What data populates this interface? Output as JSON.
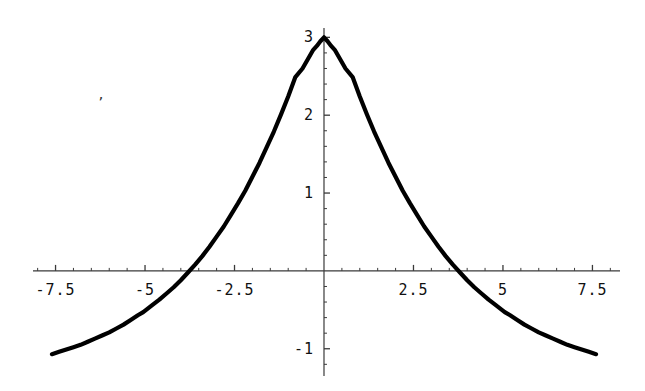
{
  "chart_data": {
    "type": "line",
    "title": "",
    "subtitle": "",
    "xlabel": "",
    "ylabel": "",
    "xlim": [
      -8.13,
      8.27
    ],
    "ylim": [
      -1.35,
      3.12
    ],
    "grid": false,
    "legend": null,
    "axes_style": "centered-cross-hairs",
    "x_tick_labels": [
      "-7.5",
      "-5",
      "-2.5",
      "2.5",
      "5",
      "7.5"
    ],
    "x_tick_values": [
      -7.5,
      -5,
      -2.5,
      2.5,
      5,
      7.5
    ],
    "y_tick_labels": [
      "3",
      "2",
      "1",
      "-1"
    ],
    "y_tick_values": [
      3,
      2,
      1,
      -1
    ],
    "x_minor_tick_step": 0.5,
    "y_minor_tick_step": 0.2,
    "annotations": [
      {
        "name": "stray-speck",
        "text": "’",
        "x": -6.35,
        "y": 2.26
      }
    ],
    "series": [
      {
        "name": "f(x)",
        "color": "#000000",
        "line_width": 4.2,
        "x": [
          -7.6,
          -7.4,
          -7.2,
          -7.0,
          -6.8,
          -6.6,
          -6.4,
          -6.2,
          -6.0,
          -5.8,
          -5.6,
          -5.4,
          -5.2,
          -5.05,
          -4.8,
          -4.6,
          -4.4,
          -4.2,
          -4.0,
          -3.8,
          -3.6,
          -3.4,
          -3.2,
          -3.0,
          -2.8,
          -2.6,
          -2.4,
          -2.2,
          -2.0,
          -1.8,
          -1.6,
          -1.4,
          -1.2,
          -1.0,
          -0.8,
          -0.6,
          -0.4,
          -0.3,
          -0.2,
          -0.1,
          0.0,
          0.1,
          0.2,
          0.3,
          0.4,
          0.6,
          0.8,
          1.0,
          1.2,
          1.4,
          1.6,
          1.8,
          2.0,
          2.2,
          2.4,
          2.6,
          2.8,
          3.0,
          3.2,
          3.4,
          3.6,
          3.8,
          4.0,
          4.2,
          4.4,
          4.6,
          4.8,
          5.05,
          5.2,
          5.4,
          5.6,
          5.8,
          6.0,
          6.2,
          6.4,
          6.6,
          6.8,
          7.0,
          7.2,
          7.4,
          7.6
        ],
        "y": [
          -1.07,
          -1.04,
          -1.01,
          -0.98,
          -0.95,
          -0.91,
          -0.87,
          -0.83,
          -0.79,
          -0.74,
          -0.69,
          -0.63,
          -0.57,
          -0.53,
          -0.44,
          -0.37,
          -0.29,
          -0.21,
          -0.12,
          -0.02,
          0.08,
          0.19,
          0.31,
          0.44,
          0.57,
          0.72,
          0.87,
          1.03,
          1.21,
          1.39,
          1.59,
          1.79,
          2.01,
          2.24,
          2.49,
          2.6,
          2.76,
          2.84,
          2.89,
          2.95,
          3.0,
          2.95,
          2.89,
          2.84,
          2.76,
          2.6,
          2.49,
          2.24,
          2.01,
          1.79,
          1.59,
          1.39,
          1.21,
          1.03,
          0.87,
          0.72,
          0.57,
          0.44,
          0.31,
          0.19,
          0.08,
          -0.02,
          -0.12,
          -0.21,
          -0.29,
          -0.37,
          -0.44,
          -0.53,
          -0.57,
          -0.63,
          -0.69,
          -0.74,
          -0.79,
          -0.83,
          -0.87,
          -0.91,
          -0.95,
          -0.98,
          -1.01,
          -1.04,
          -1.07
        ]
      }
    ]
  }
}
